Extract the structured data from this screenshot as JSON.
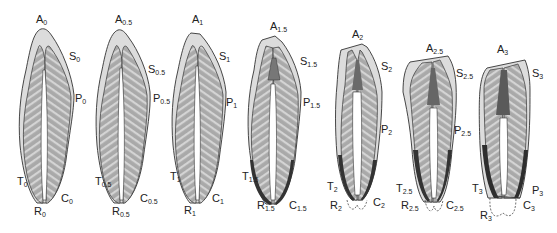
{
  "figure": {
    "colors": {
      "background": "#ffffff",
      "enamel": "#dcdcdc",
      "dentin": "#a8a8a8",
      "dentin_stripe": "#d6d6d6",
      "pulp": "#ffffff",
      "outline": "#333333",
      "dark_wear": "#3a3a3a"
    },
    "stages": [
      {
        "id": "0",
        "labels": {
          "A": "A",
          "S": "S",
          "P": "P",
          "T": "T",
          "C": "C",
          "R": "R"
        },
        "sub": "0"
      },
      {
        "id": "0.5",
        "labels": {
          "A": "A",
          "S": "S",
          "P": "P",
          "T": "T",
          "C": "C",
          "R": "R"
        },
        "sub": "0.5"
      },
      {
        "id": "1",
        "labels": {
          "A": "A",
          "S": "S",
          "P": "P",
          "T": "T",
          "C": "C",
          "R": "R"
        },
        "sub": "1"
      },
      {
        "id": "1.5",
        "labels": {
          "A": "A",
          "S": "S",
          "P": "P",
          "T": "T",
          "C": "C",
          "R": "R"
        },
        "sub": "1.5"
      },
      {
        "id": "2",
        "labels": {
          "A": "A",
          "S": "S",
          "P": "P",
          "T": "T",
          "C": "C",
          "R": "R"
        },
        "sub": "2"
      },
      {
        "id": "2.5",
        "labels": {
          "A": "A",
          "S": "S",
          "P": "P",
          "T": "T",
          "C": "C",
          "R": "R"
        },
        "sub": "2.5"
      },
      {
        "id": "3",
        "labels": {
          "A": "A",
          "S": "S",
          "P": "P",
          "T": "T",
          "C": "C",
          "R": "R"
        },
        "sub": "3"
      }
    ]
  }
}
